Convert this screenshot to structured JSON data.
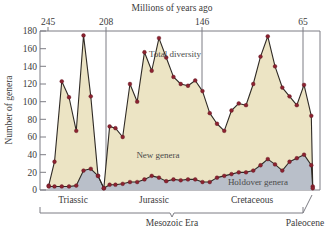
{
  "chart_data": {
    "type": "area",
    "title": "Millions of years ago",
    "xlabel": "Millions of years ago",
    "ylabel": "Number of genera",
    "xlim": [
      253,
      60
    ],
    "ylim": [
      0,
      180
    ],
    "grid": false,
    "legend": "inline-annotations",
    "x_ticks": [
      245,
      208,
      146,
      65
    ],
    "x_tick_labels": [
      "245",
      "208",
      "146",
      "65"
    ],
    "y_ticks": [
      0,
      20,
      40,
      60,
      80,
      100,
      120,
      140,
      160,
      180
    ],
    "y_tick_labels": [
      "0",
      "20",
      "40",
      "60",
      "80",
      "100",
      "120",
      "140",
      "160",
      "180"
    ],
    "annotations": [
      {
        "text": "Total diversity",
        "x": 180,
        "y": 143
      },
      {
        "text": "New genera",
        "x": 170,
        "y": 48
      },
      {
        "text": "Holdover genera",
        "x": 96,
        "y": 14
      }
    ],
    "series": [
      {
        "name": "Total diversity",
        "color": "#8c2230",
        "fill": "#ece4c4",
        "x": [
          247,
          243,
          238,
          233,
          228,
          223,
          218,
          213,
          209,
          205,
          201,
          196,
          191,
          186,
          181,
          176,
          171,
          166,
          161,
          156,
          151,
          146,
          141,
          136,
          131,
          126,
          121,
          116,
          111,
          106,
          101,
          96,
          91,
          86,
          81,
          76,
          71,
          66,
          65
        ],
        "values": [
          5,
          32,
          123,
          105,
          67,
          175,
          106,
          16,
          2,
          72,
          70,
          60,
          120,
          100,
          156,
          135,
          172,
          150,
          128,
          120,
          118,
          124,
          112,
          87,
          75,
          67,
          90,
          98,
          96,
          120,
          151,
          174,
          140,
          116,
          106,
          96,
          119,
          84,
          4
        ]
      },
      {
        "name": "New genera",
        "color": "#8c2230",
        "fill": "#b9bfc9",
        "x": [
          247,
          243,
          238,
          233,
          228,
          223,
          218,
          213,
          209,
          205,
          201,
          196,
          191,
          186,
          181,
          176,
          171,
          166,
          161,
          156,
          151,
          146,
          141,
          136,
          131,
          126,
          121,
          116,
          111,
          106,
          101,
          96,
          91,
          86,
          81,
          76,
          71,
          66,
          65
        ],
        "values": [
          4,
          4,
          4,
          4,
          5,
          22,
          24,
          16,
          2,
          6,
          6,
          7,
          9,
          9,
          12,
          16,
          14,
          10,
          12,
          11,
          12,
          12,
          9,
          9,
          14,
          16,
          18,
          20,
          20,
          22,
          28,
          35,
          29,
          22,
          32,
          36,
          40,
          28,
          2
        ]
      }
    ],
    "period_boundaries": [
      208,
      146,
      65
    ],
    "periods": [
      {
        "label": "Triassic",
        "start": 247,
        "end": 208
      },
      {
        "label": "Jurassic",
        "start": 208,
        "end": 146
      },
      {
        "label": "Cretaceous",
        "start": 146,
        "end": 65
      },
      {
        "label": "Paleocene",
        "start": 65,
        "end": 60
      }
    ],
    "era": {
      "label": "Mesozoic Era",
      "start": 247,
      "end": 65
    }
  }
}
